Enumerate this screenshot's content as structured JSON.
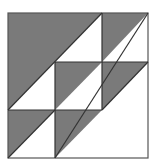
{
  "diagram": {
    "title": "",
    "grid": {
      "rows": 3,
      "cols": 3
    },
    "colors": {
      "fill": "#7a7a7a",
      "background": "#ffffff",
      "stroke": "#333333"
    },
    "bounds": {
      "x": 8,
      "y": 13,
      "size": 140
    },
    "cells": [
      {
        "row": 0,
        "col": 0,
        "shaded": "full-upper-left"
      },
      {
        "row": 0,
        "col": 1,
        "shaded": "upper-left"
      },
      {
        "row": 0,
        "col": 2,
        "shaded": "upper-left"
      },
      {
        "row": 1,
        "col": 0,
        "shaded": "upper-left"
      },
      {
        "row": 1,
        "col": 1,
        "shaded": "upper-left"
      },
      {
        "row": 1,
        "col": 2,
        "shaded": "upper-left"
      },
      {
        "row": 2,
        "col": 0,
        "shaded": "upper-left"
      },
      {
        "row": 2,
        "col": 1,
        "shaded": "upper-left"
      },
      {
        "row": 2,
        "col": 2,
        "shaded": "none"
      }
    ]
  }
}
